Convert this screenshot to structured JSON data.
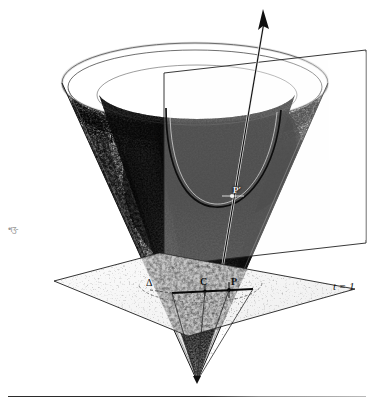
{
  "figure": {
    "background_color": "#ffffff",
    "ink_color": "#111111",
    "shade_dark": "#101010",
    "shade_mid": "#8a8a8a",
    "shade_light": "#d8d8d8"
  },
  "labels": {
    "sigma": "Σ",
    "delta": "Δ",
    "point_c": "C",
    "point_p": "P",
    "point_p_prime": "P′",
    "hyperplane": "t = 1",
    "margin_artifact": "•ıʒ‐"
  },
  "elements": {
    "cone_name": "light-cone",
    "axis_arrow_name": "time-axis-arrow",
    "slice_plane_name": "vertical-slice-plane",
    "horizontal_plane_name": "t-equals-1-plane",
    "parabola_name": "parabola-curve",
    "chord_name": "chord-c-p",
    "baseline_name": "page-rule"
  },
  "geometry": {
    "apex": [
      197,
      381
    ],
    "rim_center": [
      195,
      83
    ],
    "rim_rx": 133,
    "rim_ry": 40,
    "arrow_tip": [
      263,
      10
    ],
    "chord_from": [
      172,
      293
    ],
    "chord_to": [
      253,
      289
    ],
    "point_c": [
      205,
      291
    ],
    "point_p": [
      229,
      290
    ],
    "point_p_prime": [
      232,
      196
    ]
  }
}
